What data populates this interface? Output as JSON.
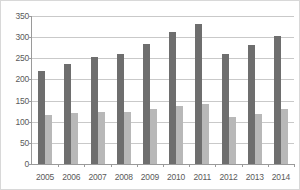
{
  "chart_data": {
    "type": "bar",
    "title": "",
    "subtitle": "",
    "xlabel": "",
    "ylabel": "",
    "categories": [
      "2005",
      "2006",
      "2007",
      "2008",
      "2009",
      "2010",
      "2011",
      "2012",
      "2013",
      "2014"
    ],
    "series": [
      {
        "name": "series-a",
        "color": "#6e6e6e",
        "values": [
          221,
          236,
          252,
          260,
          285,
          312,
          330,
          260,
          282,
          303
        ]
      },
      {
        "name": "series-b",
        "color": "#b8b8b8",
        "values": [
          117,
          120,
          122,
          123,
          129,
          137,
          141,
          111,
          119,
          129
        ]
      }
    ],
    "ylim": [
      0,
      350
    ],
    "ytick_step": 50,
    "yticks": [
      "0",
      "50",
      "100",
      "150",
      "200",
      "250",
      "300",
      "350"
    ],
    "grid": "horizontal",
    "legend": "none",
    "colors": {
      "series_a": "#6e6e6e",
      "series_b": "#b8b8b8",
      "gridline": "#c9c9c9",
      "axis": "#9a9a9a",
      "tick_text": "#5a5a5a",
      "background": "#ffffff",
      "border": "#d8d8d8"
    }
  }
}
